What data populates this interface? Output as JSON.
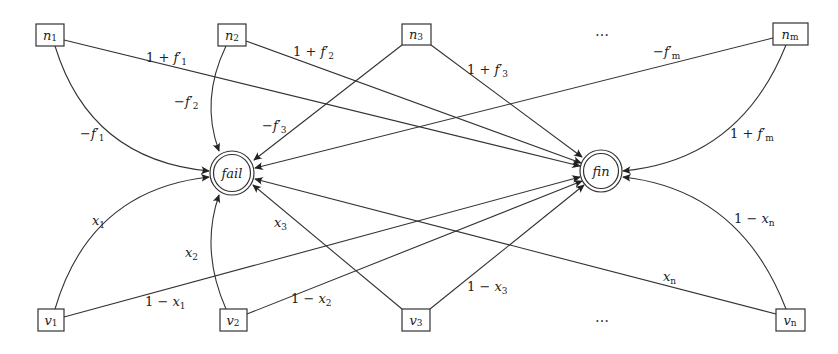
{
  "diagram": {
    "type": "weighted transition graph",
    "top_nodes": [
      {
        "id": "n1",
        "base": "n",
        "sub": "1",
        "x": 50,
        "y": 35
      },
      {
        "id": "n2",
        "base": "n",
        "sub": "2",
        "x": 232,
        "y": 35
      },
      {
        "id": "n3",
        "base": "n",
        "sub": "3",
        "x": 416,
        "y": 34
      },
      {
        "id": "nm",
        "base": "n",
        "sub": "m",
        "x": 790,
        "y": 34
      }
    ],
    "bottom_nodes": [
      {
        "id": "v1",
        "base": "v",
        "sub": "1",
        "x": 51,
        "y": 320
      },
      {
        "id": "v2",
        "base": "v",
        "sub": "2",
        "x": 233,
        "y": 320
      },
      {
        "id": "v3",
        "base": "v",
        "sub": "3",
        "x": 416,
        "y": 320
      },
      {
        "id": "vn",
        "base": "v",
        "sub": "n",
        "x": 790,
        "y": 320
      }
    ],
    "states": [
      {
        "id": "fail",
        "label": "fail",
        "x": 232,
        "y": 173
      },
      {
        "id": "fin",
        "label": "fin",
        "x": 601,
        "y": 171
      }
    ],
    "ellipsis_top": "…",
    "ellipsis_bottom": "…",
    "edges": [
      {
        "from": "n1",
        "to": "fin",
        "label": "1 + f′₁"
      },
      {
        "from": "n1",
        "to": "fail",
        "label": "−f′₁"
      },
      {
        "from": "n2",
        "to": "fin",
        "label": "1 + f′₂"
      },
      {
        "from": "n2",
        "to": "fail",
        "label": "−f′₂"
      },
      {
        "from": "n3",
        "to": "fin",
        "label": "1 + f′₃"
      },
      {
        "from": "n3",
        "to": "fail",
        "label": "−f′₃"
      },
      {
        "from": "nm",
        "to": "fail",
        "label": "−f′ₘ"
      },
      {
        "from": "nm",
        "to": "fin",
        "label": "1 + f′ₘ"
      },
      {
        "from": "v1",
        "to": "fail",
        "label": "x₁"
      },
      {
        "from": "v1",
        "to": "fin",
        "label": "1 − x₁"
      },
      {
        "from": "v2",
        "to": "fail",
        "label": "x₂"
      },
      {
        "from": "v2",
        "to": "fin",
        "label": "1 − x₂"
      },
      {
        "from": "v3",
        "to": "fail",
        "label": "x₃"
      },
      {
        "from": "v3",
        "to": "fin",
        "label": "1 − x₃"
      },
      {
        "from": "vn",
        "to": "fail",
        "label": "xₙ"
      },
      {
        "from": "vn",
        "to": "fin",
        "label": "1 − xₙ"
      }
    ]
  }
}
